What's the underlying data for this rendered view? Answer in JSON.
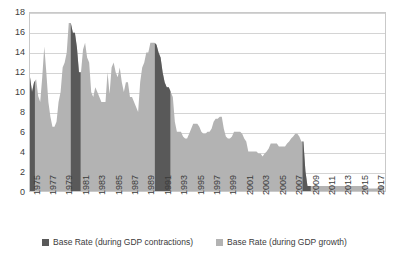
{
  "chart_data": {
    "type": "area",
    "title": "",
    "subtitle": "",
    "xlabel": "",
    "ylabel": "",
    "xlim": [
      1975,
      2018.5
    ],
    "ylim": [
      0,
      18
    ],
    "grid": true,
    "legend_position": "bottom",
    "y_ticks": [
      0,
      2,
      4,
      6,
      8,
      10,
      12,
      14,
      16,
      18
    ],
    "x_ticks": [
      1975,
      1977,
      1979,
      1981,
      1983,
      1985,
      1987,
      1989,
      1991,
      1993,
      1995,
      1997,
      1999,
      2001,
      2003,
      2005,
      2007,
      2009,
      2011,
      2013,
      2015,
      2017
    ],
    "colors": {
      "contraction": "#595959",
      "growth": "#b3b3b3",
      "gridline": "#d4d4d4",
      "frame": "#c9c9c9",
      "text": "#3b3b3b",
      "background": "#ffffff"
    },
    "series": [
      {
        "name": "Base Rate (during GDP contractions)",
        "color": "#595959",
        "key": "contraction"
      },
      {
        "name": "Base Rate (during GDP growth)",
        "color": "#b3b3b3",
        "key": "growth"
      }
    ],
    "x": [
      1975.0,
      1975.25,
      1975.5,
      1975.75,
      1976.0,
      1976.25,
      1976.5,
      1976.75,
      1977.0,
      1977.25,
      1977.5,
      1977.75,
      1978.0,
      1978.25,
      1978.5,
      1978.75,
      1979.0,
      1979.25,
      1979.5,
      1979.75,
      1980.0,
      1980.25,
      1980.5,
      1980.75,
      1981.0,
      1981.25,
      1981.5,
      1981.75,
      1982.0,
      1982.25,
      1982.5,
      1982.75,
      1983.0,
      1983.25,
      1983.5,
      1983.75,
      1984.0,
      1984.25,
      1984.5,
      1984.75,
      1985.0,
      1985.25,
      1985.5,
      1985.75,
      1986.0,
      1986.25,
      1986.5,
      1986.75,
      1987.0,
      1987.25,
      1987.5,
      1987.75,
      1988.0,
      1988.25,
      1988.5,
      1988.75,
      1989.0,
      1989.25,
      1989.5,
      1989.75,
      1990.0,
      1990.25,
      1990.5,
      1990.75,
      1991.0,
      1991.25,
      1991.5,
      1991.75,
      1992.0,
      1992.25,
      1992.5,
      1992.75,
      1993.0,
      1993.25,
      1993.5,
      1993.75,
      1994.0,
      1994.25,
      1994.5,
      1994.75,
      1995.0,
      1995.25,
      1995.5,
      1995.75,
      1996.0,
      1996.25,
      1996.5,
      1996.75,
      1997.0,
      1997.25,
      1997.5,
      1997.75,
      1998.0,
      1998.25,
      1998.5,
      1998.75,
      1999.0,
      1999.25,
      1999.5,
      1999.75,
      2000.0,
      2000.25,
      2000.5,
      2000.75,
      2001.0,
      2001.25,
      2001.5,
      2001.75,
      2002.0,
      2002.25,
      2002.5,
      2002.75,
      2003.0,
      2003.25,
      2003.5,
      2003.75,
      2004.0,
      2004.25,
      2004.5,
      2004.75,
      2005.0,
      2005.25,
      2005.5,
      2005.75,
      2006.0,
      2006.25,
      2006.5,
      2006.75,
      2007.0,
      2007.25,
      2007.5,
      2007.75,
      2008.0,
      2008.25,
      2008.5,
      2008.75,
      2009.0,
      2009.25,
      2009.5,
      2009.75,
      2010.0,
      2010.5,
      2011.0,
      2011.5,
      2012.0,
      2012.5,
      2013.0,
      2013.5,
      2014.0,
      2014.5,
      2015.0,
      2015.5,
      2016.0,
      2016.5,
      2017.0,
      2017.5,
      2018.0,
      2018.4
    ],
    "values": [
      11.5,
      10.0,
      11.0,
      11.3,
      9.6,
      9.0,
      11.5,
      14.6,
      12.0,
      9.0,
      7.5,
      6.5,
      6.5,
      7.0,
      9.0,
      10.0,
      12.5,
      13.0,
      14.0,
      17.0,
      17.0,
      16.0,
      16.0,
      14.5,
      12.0,
      12.0,
      14.3,
      15.0,
      13.5,
      13.0,
      10.0,
      9.5,
      10.5,
      10.0,
      9.5,
      9.0,
      9.0,
      9.0,
      12.0,
      9.8,
      12.5,
      13.0,
      12.0,
      11.5,
      12.5,
      11.0,
      10.0,
      11.0,
      11.0,
      9.5,
      9.5,
      9.0,
      8.5,
      8.0,
      11.0,
      12.5,
      13.0,
      14.0,
      14.0,
      15.0,
      15.0,
      15.0,
      14.8,
      14.0,
      13.5,
      12.0,
      11.0,
      10.5,
      10.5,
      10.0,
      9.5,
      7.0,
      6.0,
      6.0,
      6.0,
      5.5,
      5.3,
      5.3,
      5.8,
      6.3,
      6.8,
      6.8,
      6.8,
      6.5,
      6.0,
      5.8,
      5.8,
      6.0,
      6.0,
      6.3,
      7.0,
      7.3,
      7.3,
      7.5,
      7.5,
      6.3,
      5.5,
      5.3,
      5.3,
      5.5,
      6.0,
      6.0,
      6.0,
      6.0,
      5.8,
      5.3,
      5.0,
      4.0,
      4.0,
      4.0,
      4.0,
      4.0,
      3.8,
      3.8,
      3.5,
      3.8,
      4.0,
      4.3,
      4.8,
      4.8,
      4.8,
      4.8,
      4.5,
      4.5,
      4.5,
      4.5,
      4.8,
      5.0,
      5.3,
      5.5,
      5.8,
      5.8,
      5.5,
      5.0,
      5.0,
      2.0,
      0.5,
      0.5,
      0.5,
      0.5,
      0.5,
      0.5,
      0.5,
      0.5,
      0.5,
      0.5,
      0.5,
      0.5,
      0.5,
      0.5,
      0.5,
      0.5,
      0.5,
      0.25,
      0.25,
      0.25,
      0.5,
      0.5
    ],
    "contraction_periods": [
      {
        "start": 1975.0,
        "end": 1975.6,
        "label": "1974-75 recession"
      },
      {
        "start": 1980.0,
        "end": 1981.2,
        "label": "1980-81 recession"
      },
      {
        "start": 1990.3,
        "end": 1992.2,
        "label": "1990-92 recession"
      },
      {
        "start": 2008.4,
        "end": 2009.4,
        "label": "2008-09 recession"
      }
    ],
    "notable_points": [
      {
        "year": 1980,
        "value": 17.0,
        "note": "peak base rate"
      },
      {
        "year": 1976.75,
        "value": 14.6,
        "note": "1976 sterling crisis spike"
      },
      {
        "year": 1990.5,
        "value": 14.8,
        "note": "ERM-era peak"
      },
      {
        "year": 2009,
        "value": 0.5,
        "note": "record low after crisis"
      },
      {
        "year": 2016.5,
        "value": 0.25,
        "note": "post-referendum cut"
      }
    ]
  },
  "legend": {
    "items": [
      {
        "label": "Base Rate (during GDP contractions)",
        "color": "#595959"
      },
      {
        "label": "Base Rate (during GDP growth)",
        "color": "#b3b3b3"
      }
    ]
  }
}
